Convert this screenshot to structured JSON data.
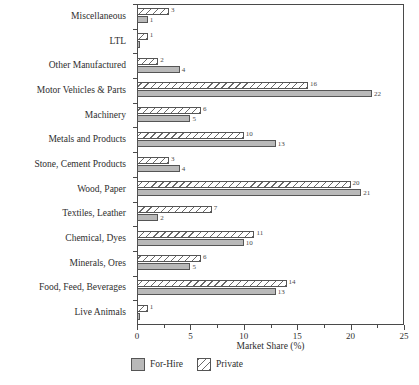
{
  "chart_data": {
    "type": "bar",
    "orientation": "horizontal",
    "title": "",
    "xlabel": "Market Share (%)",
    "ylabel": "",
    "xlim": [
      0,
      25
    ],
    "xticks": [
      0,
      5,
      10,
      15,
      20,
      25
    ],
    "xtick_labels": [
      "0",
      "5",
      "10",
      "15",
      "20",
      "25"
    ],
    "minor_xticks": [
      2.5,
      7.5,
      12.5,
      17.5,
      22.5
    ],
    "grid": false,
    "legend_position": "below-axis-left",
    "categories": [
      "Miscellaneous",
      "LTL",
      "Other Manufactured",
      "Motor Vehicles & Parts",
      "Machinery",
      "Metals and Products",
      "Stone, Cement Products",
      "Wood, Paper",
      "Textiles, Leather",
      "Chemical, Dyes",
      "Minerals, Ores",
      "Food, Feed, Beverages",
      "Live Animals"
    ],
    "series": [
      {
        "name": "Private",
        "style": "hatched",
        "values": [
          3,
          1,
          2,
          16,
          6,
          10,
          3,
          20,
          7,
          11,
          6,
          14,
          1
        ],
        "labels": [
          "3",
          "1",
          "2",
          "16",
          "6",
          "10",
          "3",
          "20",
          "7",
          "11",
          "6",
          "14",
          "1"
        ]
      },
      {
        "name": "For-Hire",
        "style": "solid-gray",
        "values": [
          1,
          0.3,
          4,
          22,
          5,
          13,
          4,
          21,
          2,
          10,
          5,
          13,
          0.3
        ],
        "labels": [
          "1",
          "",
          "4",
          "22",
          "5",
          "13",
          "4",
          "21",
          "2",
          "10",
          "5",
          "13",
          ""
        ]
      }
    ]
  },
  "legend": {
    "items": [
      {
        "label": "For-Hire",
        "style": "forhire"
      },
      {
        "label": "Private",
        "style": "private"
      }
    ]
  },
  "colors": {
    "forhire_fill": "#b9b9b9",
    "private_hatch": "#6b6b6b",
    "axis": "#4a4a4a",
    "text": "#2e2e2e"
  }
}
